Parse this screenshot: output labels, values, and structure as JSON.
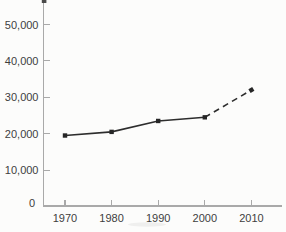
{
  "figure": {
    "background": "#fcfcfb",
    "top_cropped": true
  },
  "chart_data": {
    "type": "line",
    "title": "",
    "xlabel": "",
    "ylabel": "",
    "categories": [
      "1970",
      "1980",
      "1990",
      "2000",
      "2010"
    ],
    "values": [
      19500,
      20500,
      23500,
      24500,
      32000
    ],
    "series": [
      {
        "name": "series-1",
        "values": [
          19500,
          20500,
          23500,
          24500,
          32000
        ]
      }
    ],
    "dash_start_index": 3,
    "y_ticks": [
      {
        "value": 0,
        "label": "0"
      },
      {
        "value": 10000,
        "label": "10,000"
      },
      {
        "value": 20000,
        "label": "20,000"
      },
      {
        "value": 30000,
        "label": "30,000"
      },
      {
        "value": 40000,
        "label": "40,000"
      },
      {
        "value": 50000,
        "label": "50,000"
      }
    ],
    "ylim": [
      0,
      56500
    ],
    "grid": false,
    "legend": null,
    "marker": "square",
    "colors": {
      "line": "#2d2d2d",
      "marker": "#262626",
      "axis": "#a9a9a9",
      "tick_label": "#3e3e3e"
    }
  }
}
